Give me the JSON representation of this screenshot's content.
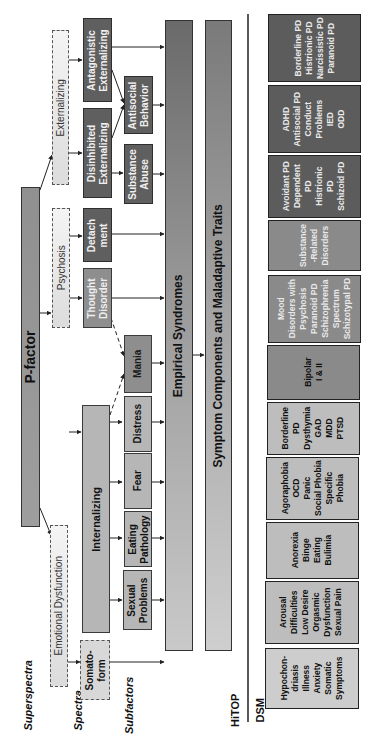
{
  "level_labels": {
    "superspectra": "Superspectra",
    "spectra": "Spectra",
    "subfactors": "Subfactors",
    "hitop": "HiTOP",
    "dsm": "DSM"
  },
  "p_factor": {
    "label": "P-factor"
  },
  "superspectra": [
    {
      "id": "externalizing",
      "label": "Externalizing"
    },
    {
      "id": "psychosis",
      "label": "Psychosis"
    },
    {
      "id": "emotional-dysfunction",
      "label": "Emotional Dysfunction"
    }
  ],
  "spectra": [
    {
      "id": "antagonistic-externalizing",
      "label": "Antagonistic Externalizing"
    },
    {
      "id": "disinhibited-externalizing",
      "label": "Disinhibited Externalizing"
    },
    {
      "id": "detachment",
      "label": "Detach ment"
    },
    {
      "id": "thought-disorder",
      "label": "Thought Disorder"
    },
    {
      "id": "internalizing",
      "label": "Internalizing"
    },
    {
      "id": "somatoform",
      "label": "Somato- form"
    }
  ],
  "subfactors": [
    {
      "id": "antisocial-behavior",
      "label": "Antisocial Behavior"
    },
    {
      "id": "substance-abuse",
      "label": "Substance Abuse"
    },
    {
      "id": "mania",
      "label": "Mania"
    },
    {
      "id": "distress",
      "label": "Distress"
    },
    {
      "id": "fear",
      "label": "Fear"
    },
    {
      "id": "eating-pathology",
      "label": "Eating Pathology"
    },
    {
      "id": "sexual-problems",
      "label": "Sexual Problems"
    }
  ],
  "bars": {
    "empirical_syndromes": "Empirical Syndromes",
    "symptom_components": "Symptom Components and Maladaptive Traits"
  },
  "dsm_groups": [
    {
      "id": "antagonistic",
      "items": [
        "Borderline PD",
        "Histrionic PD",
        "Narcissistic PD",
        "Paranoid PD"
      ]
    },
    {
      "id": "antisocial",
      "items": [
        "ADHD",
        "Antisocial PD",
        "Conduct Problems",
        "IED",
        "ODD"
      ]
    },
    {
      "id": "detachment",
      "items": [
        "Avoidant PD",
        "Dependent PD",
        "Histrionic PD",
        "Schizoid PD"
      ]
    },
    {
      "id": "substance",
      "items": [
        "Substance -Related Disorders"
      ]
    },
    {
      "id": "thought",
      "items": [
        "Mood Disorders with Psychosis",
        "Paranoid PD",
        "Schizophrenia Spectrum",
        "Schizotypal PD"
      ]
    },
    {
      "id": "mania",
      "items": [
        "Bipolar I & II"
      ]
    },
    {
      "id": "distress",
      "items": [
        "Borderline PD",
        "Dysthymia",
        "GAD",
        "MDD",
        "PTSD"
      ]
    },
    {
      "id": "fear",
      "items": [
        "Agoraphobia",
        "OCD",
        "Panic",
        "Social Phobia",
        "Specific Phobia"
      ]
    },
    {
      "id": "eating",
      "items": [
        "Anorexia",
        "Binge Eating",
        "Bulimia"
      ]
    },
    {
      "id": "sexual",
      "items": [
        "Arousal Difficulties",
        "Low Desire",
        "Orgasmic Dysfunction",
        "Sexual Pain"
      ]
    },
    {
      "id": "somatoform",
      "items": [
        "Hypochon- driasis",
        "Illness Anxiety",
        "Somatic Symptoms"
      ]
    }
  ]
}
